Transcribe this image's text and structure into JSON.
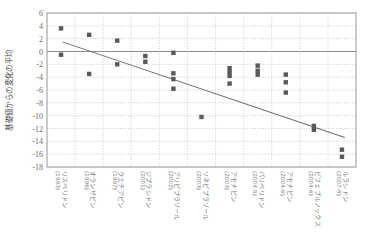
{
  "chart_data": {
    "type": "scatter",
    "title": "",
    "xlabel": "",
    "ylabel": "基礎値からの変化の平均",
    "ylim": [
      -18,
      6
    ],
    "yticks": [
      6,
      4,
      2,
      0,
      -2,
      -4,
      -6,
      -8,
      -10,
      -12,
      -14,
      -16,
      -18
    ],
    "ytick_labels": [
      "6",
      "4",
      "2",
      "0",
      "-2",
      "-4",
      "-6",
      "-8",
      "-10",
      "-12",
      "-14",
      "-16",
      "-18"
    ],
    "grid": true,
    "legend": "none",
    "categories": [
      "リスペリドン\n(1993)",
      "オランザピン\n(1996)",
      "クエチアピン\n(1997)",
      "ジプラシドン\n(2001)",
      "アリピプラゾール\n(2002)",
      "ソネピプラゾール\n(2003)",
      "アセナピン\n(2003)",
      "パリペリドン\n(2004-5)",
      "アセナピン\n(2004-6)",
      "ビフェプルノックス\n(2004-6)",
      "ルラシドン\n(2007-8)"
    ],
    "category_labels_vertical": [
      {
        "drug": "リスペリドン",
        "year": "(1993)"
      },
      {
        "drug": "オランザピン",
        "year": "(1996)"
      },
      {
        "drug": "クエチアピン",
        "year": "(1997)"
      },
      {
        "drug": "ジプラシドン",
        "year": "(2001)"
      },
      {
        "drug": "アリピプラゾール",
        "year": "(2002)"
      },
      {
        "drug": "ソネピプラゾール",
        "year": "(2003)"
      },
      {
        "drug": "アセナピン",
        "year": "(2003)"
      },
      {
        "drug": "パリペリドン",
        "year": "(2004-5)"
      },
      {
        "drug": "アセナピン",
        "year": "(2004-6)"
      },
      {
        "drug": "ビフェプルノックス",
        "year": "(2004-6)"
      },
      {
        "drug": "ルラシドン",
        "year": "(2007-8)"
      }
    ],
    "series": [
      {
        "name": "試験結果",
        "marker": "square",
        "color": "#5a5a5a",
        "points": [
          {
            "cat": 0,
            "y": 3.6
          },
          {
            "cat": 0,
            "y": -0.5
          },
          {
            "cat": 1,
            "y": 2.6
          },
          {
            "cat": 1,
            "y": -3.5
          },
          {
            "cat": 2,
            "y": 1.7
          },
          {
            "cat": 2,
            "y": -2.0
          },
          {
            "cat": 3,
            "y": -0.7
          },
          {
            "cat": 3,
            "y": -1.6
          },
          {
            "cat": 4,
            "y": -0.2
          },
          {
            "cat": 4,
            "y": -3.4
          },
          {
            "cat": 4,
            "y": -4.3
          },
          {
            "cat": 4,
            "y": -5.8
          },
          {
            "cat": 5,
            "y": -10.2
          },
          {
            "cat": 6,
            "y": -2.6
          },
          {
            "cat": 6,
            "y": -3.2
          },
          {
            "cat": 6,
            "y": -3.8
          },
          {
            "cat": 6,
            "y": -5.0
          },
          {
            "cat": 7,
            "y": -2.2
          },
          {
            "cat": 7,
            "y": -3.0
          },
          {
            "cat": 7,
            "y": -3.6
          },
          {
            "cat": 8,
            "y": -3.6
          },
          {
            "cat": 8,
            "y": -4.8
          },
          {
            "cat": 8,
            "y": -6.4
          },
          {
            "cat": 9,
            "y": -11.6
          },
          {
            "cat": 9,
            "y": -12.2
          },
          {
            "cat": 10,
            "y": -15.3
          },
          {
            "cat": 10,
            "y": -16.4
          }
        ]
      }
    ],
    "trendline": {
      "name": "回帰直線",
      "color": "#6b6b6b",
      "x_start": 0.55,
      "y_start": 1.5,
      "x_end": 10.6,
      "y_end": -13.4
    },
    "zero_line": {
      "value": 0,
      "color": "#8c8c8c"
    }
  },
  "axis": {
    "y_title": "基礎値からの変化の平均"
  }
}
